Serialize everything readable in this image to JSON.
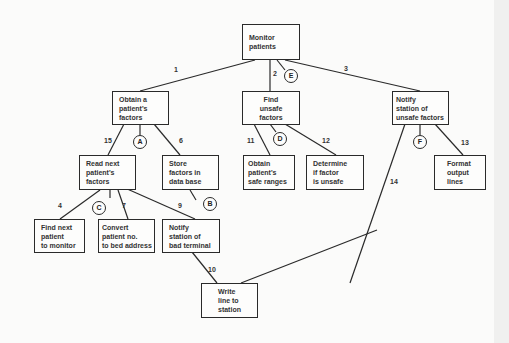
{
  "diagram": {
    "type": "structure-chart",
    "nodes": {
      "monitor": "Monitor\npatients",
      "obtain": "Obtain a\npatient's\nfactors",
      "find_unsafe": "Find\nunsafe\nfactors",
      "notify_unsafe": "Notify\nstation of\nunsafe factors",
      "read_next": "Read next\npatient's\nfactors",
      "store": "Store\nfactors in\ndata base",
      "obtain_safe": "Obtain\npatient's\nsafe ranges",
      "determine": "Determine\nif factor\nis unsafe",
      "format": "Format\noutput\nlines",
      "find_next": "Find next\npatient\nto monitor",
      "convert": "Convert\npatient no.\nto bed address",
      "notify_bad": "Notify\nstation of\nbad terminal",
      "write": "Write\nline to\nstation"
    },
    "edge_labels": {
      "e1": "1",
      "e2": "2",
      "e3": "3",
      "e4": "4",
      "e6": "6",
      "e7": "7",
      "e9": "9",
      "e10": "10",
      "e11": "11",
      "e12": "12",
      "e13": "13",
      "e14": "14",
      "e15": "15"
    },
    "connectors": {
      "A": "A",
      "B": "B",
      "C": "C",
      "D": "D",
      "E": "E",
      "F": "F"
    }
  }
}
